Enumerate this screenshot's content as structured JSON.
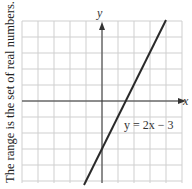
{
  "caption": "The range is the set of real numbers.",
  "chart_data": {
    "type": "line",
    "title": "",
    "xlabel": "x",
    "ylabel": "y",
    "xlim": [
      -5,
      5
    ],
    "ylim": [
      -5,
      5
    ],
    "grid": true,
    "series": [
      {
        "name": "y = 2x − 3",
        "equation": "y = 2x − 3",
        "slope": 2,
        "intercept": -3,
        "x": [
          -1,
          0,
          1.5,
          4
        ],
        "values": [
          -5,
          -3,
          0,
          5
        ]
      }
    ],
    "annotations": [
      {
        "text": "y = 2x − 3",
        "x": 4,
        "y": -1.5
      }
    ]
  },
  "labels": {
    "x_axis": "x",
    "y_axis": "y",
    "equation": "y = 2x − 3"
  },
  "colors": {
    "grid": "#cfcfcf",
    "axis": "#333333",
    "line": "#2a2a2a"
  }
}
